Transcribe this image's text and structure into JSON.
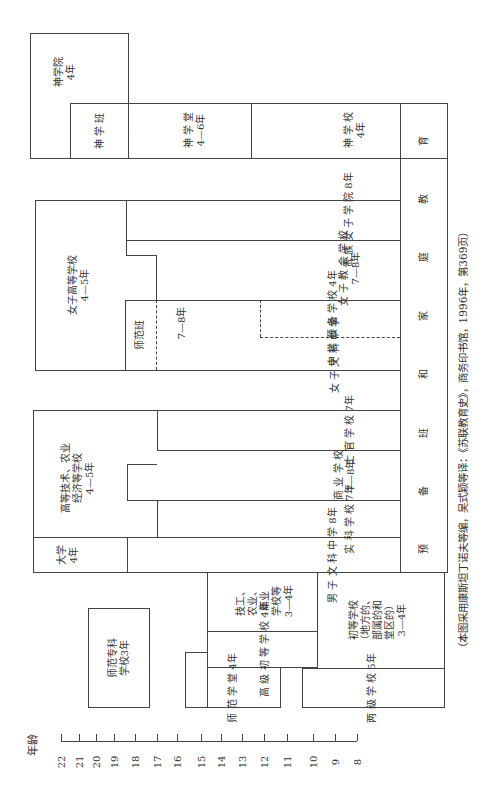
{
  "axis": {
    "title": "年龄",
    "ticks": [
      "22",
      "21",
      "20",
      "19",
      "18",
      "17",
      "16",
      "15",
      "14",
      "13",
      "12",
      "11",
      "10",
      "9",
      "8"
    ]
  },
  "blocks": {
    "theology_academy": "神学院\n4年",
    "theology_class": "神 学 班",
    "theology_hall": "神 学 堂\n4—6年",
    "theology_school": "神 学 校\n4年",
    "prep_family": "预  备  班  和  家  庭  教  育",
    "women_higher": "女子高等学校\n4—5年",
    "noble_women": "贵 族 女 子 学 院 8年",
    "women_church": "女 子 教 会 学 校\n7—8年",
    "normal_class": "师范班",
    "years_7_8": "7—8年",
    "secondary_prep": "中 学 预 备 学 校 4年",
    "women_classical": "女 子 文 科 中 学",
    "higher_tech": "高等技术、农业\n经济等学校\n4—5年",
    "cadet_school": "士 官 学 校 7年",
    "commerce_school": "商 业 学 校\n7—8年",
    "real_school": "实 科 学 校 7年",
    "university": "大学\n4年",
    "men_classical": "男 子 文 科 中 学 8年",
    "vocational": "技工、\n农业、\n商业\n学校等\n3—4年",
    "higher_primary": "高 级 初 等 学 校 4年",
    "normal_hall": "师 范 学 堂 4年",
    "primary_school": "初等学校\n（地方的、\n部属的和\n堂区的）\n3—4年",
    "two_level_school": "两 级 学 校 5年",
    "normal_college": "师范专科\n学校3年"
  },
  "caption": "（本图采用康斯坦丁诺夫等编，吴式颖等译：《苏联教育史》，商务印书馆，1996年，第369页）"
}
